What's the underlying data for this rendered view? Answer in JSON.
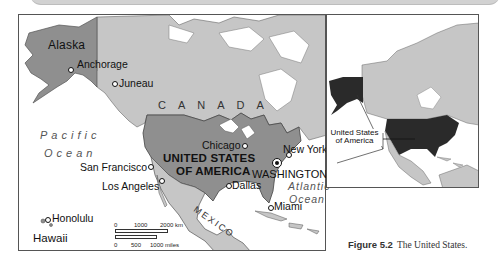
{
  "figure": {
    "number_label": "Figure 5.2",
    "title": "The United States."
  },
  "main_map": {
    "regions": {
      "alaska": "Alaska",
      "canada": "CANADA",
      "usa_line1": "UNITED STATES",
      "usa_line2": "OF AMERICA",
      "mexico": "MEXICO",
      "hawaii": "Hawaii"
    },
    "oceans": {
      "pacific_line1": "Pacific",
      "pacific_line2": "Ocean",
      "atlantic_line1": "Atlantic",
      "atlantic_line2": "Ocean"
    },
    "cities": [
      {
        "name": "Anchorage"
      },
      {
        "name": "Juneau"
      },
      {
        "name": "Chicago"
      },
      {
        "name": "New York"
      },
      {
        "name": "San Francisco"
      },
      {
        "name": "Los Angeles"
      },
      {
        "name": "Dallas"
      },
      {
        "name": "Miami"
      },
      {
        "name": "Honolulu"
      }
    ],
    "capital": "WASHINGTON",
    "scale": {
      "km_ticks": [
        "0",
        "1000",
        "2000 km"
      ],
      "mile_ticks": [
        "0",
        "500",
        "1000 miles"
      ]
    }
  },
  "inset_map": {
    "label_line1": "United States",
    "label_line2": "of America"
  },
  "colors": {
    "usa_fill": "#8f8f8f",
    "land_fill": "#c6c6c6",
    "inset_usa_fill": "#2a2a2a",
    "water": "#ffffff",
    "border": "#555555"
  }
}
